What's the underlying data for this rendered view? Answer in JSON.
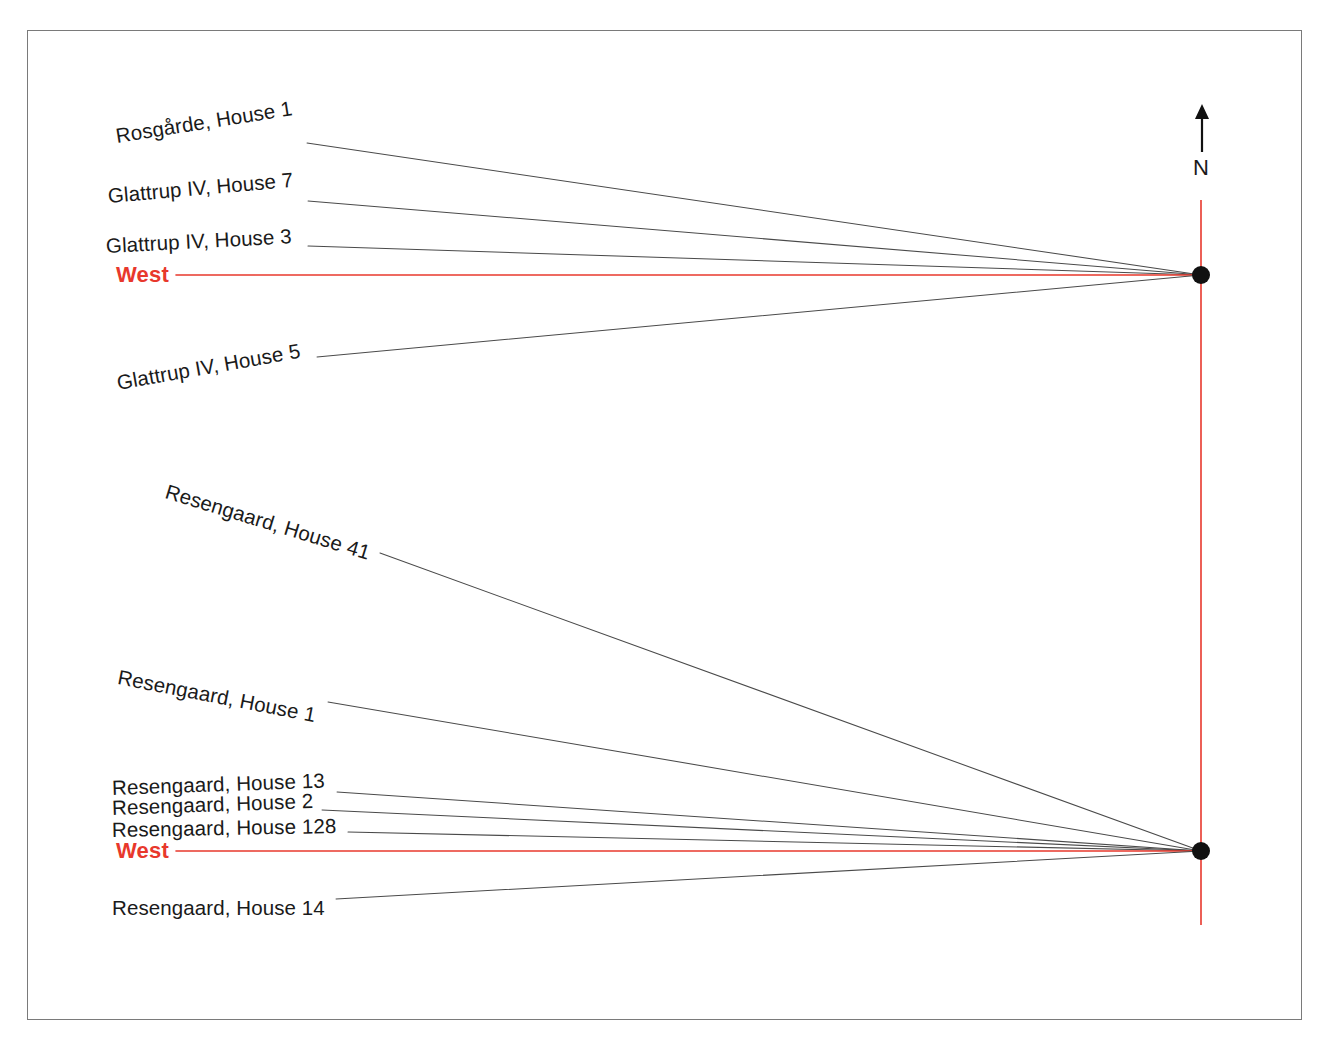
{
  "diagram": {
    "type": "radial-orientation-diagram",
    "background_color": "#ffffff",
    "frame_color": "#7a7a7a",
    "accent_color": "#e8382c",
    "line_color": "#4a4a4a",
    "node_color": "#111111",
    "compass": {
      "label": "N",
      "icon": "north-arrow-icon",
      "arrow_x": 1202,
      "arrow_top_y": 104,
      "arrow_bottom_y": 152,
      "letter_x": 1193,
      "letter_y": 155
    },
    "axis": {
      "orientation": "vertical",
      "x": 1201,
      "y_top": 200,
      "y_bottom": 925,
      "color": "#e8382c"
    },
    "nodes": [
      {
        "name": "upper-node",
        "x": 1201,
        "y": 275,
        "radius": 9
      },
      {
        "name": "lower-node",
        "x": 1201,
        "y": 851,
        "radius": 9
      }
    ],
    "groups": [
      {
        "name": "upper-group",
        "node": {
          "x": 1201,
          "y": 275
        },
        "entries": [
          {
            "label": "Rosgårde, House 1",
            "label_x": 116,
            "label_y": 136,
            "rotation": -9,
            "line_x": 307,
            "line_y": 143,
            "is_west": false
          },
          {
            "label": "Glattrup IV, House 7",
            "label_x": 108,
            "label_y": 196,
            "rotation": -5,
            "line_x": 308,
            "line_y": 201,
            "is_west": false
          },
          {
            "label": "Glattrup IV, House 3",
            "label_x": 106,
            "label_y": 246,
            "rotation": -3,
            "line_x": 308,
            "line_y": 246,
            "is_west": false
          },
          {
            "label": "West",
            "label_x": 116,
            "label_y": 275,
            "rotation": 0,
            "line_x": 176,
            "line_y": 275,
            "is_west": true
          },
          {
            "label": "Glattrup IV, House 5",
            "label_x": 117,
            "label_y": 383,
            "rotation": -10,
            "line_x": 317,
            "line_y": 357,
            "is_west": false
          }
        ]
      },
      {
        "name": "lower-group",
        "node": {
          "x": 1201,
          "y": 851
        },
        "entries": [
          {
            "label": "Resengaard, House 41",
            "label_x": 166,
            "label_y": 491,
            "rotation": 17,
            "line_x": 380,
            "line_y": 553,
            "is_west": false
          },
          {
            "label": "Resengaard, House 1",
            "label_x": 118,
            "label_y": 677,
            "rotation": 11,
            "line_x": 328,
            "line_y": 702,
            "is_west": false
          },
          {
            "label": "Resengaard, House 13",
            "label_x": 112,
            "label_y": 788,
            "rotation": -2,
            "line_x": 337,
            "line_y": 792,
            "is_west": false
          },
          {
            "label": "Resengaard, House 2",
            "label_x": 112,
            "label_y": 808,
            "rotation": -2,
            "line_x": 322,
            "line_y": 810,
            "is_west": false
          },
          {
            "label": "Resengaard, House 128",
            "label_x": 112,
            "label_y": 830,
            "rotation": -1,
            "line_x": 348,
            "line_y": 832,
            "is_west": false
          },
          {
            "label": "West",
            "label_x": 116,
            "label_y": 851,
            "rotation": 0,
            "line_x": 176,
            "line_y": 851,
            "is_west": true
          },
          {
            "label": "Resengaard, House 14",
            "label_x": 112,
            "label_y": 908,
            "rotation": 0,
            "line_x": 336,
            "line_y": 899,
            "is_west": false
          }
        ]
      }
    ]
  }
}
